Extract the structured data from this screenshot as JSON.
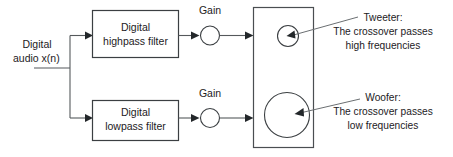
{
  "diagram": {
    "input": {
      "label_line1": "Digital",
      "label_line2_prefix": "audio ",
      "label_line2_signal": "x(n)"
    },
    "blocks": [
      {
        "id": "highpass",
        "label_line1": "Digital",
        "label_line2": "highpass filter"
      },
      {
        "id": "lowpass",
        "label_line1": "Digital",
        "label_line2": "lowpass filter"
      }
    ],
    "gains": [
      {
        "id": "gain-high",
        "label": "Gain"
      },
      {
        "id": "gain-low",
        "label": "Gain"
      }
    ],
    "speaker": {
      "cabinet_label": "Loudspeaker cabinet",
      "drivers": [
        {
          "id": "tweeter",
          "name": "Tweeter"
        },
        {
          "id": "woofer",
          "name": "Woofer"
        }
      ]
    },
    "annotations": [
      {
        "id": "tweeter-note",
        "line1": "Tweeter:",
        "line2": "The crossover passes",
        "line3": "high frequencies"
      },
      {
        "id": "woofer-note",
        "line1": "Woofer:",
        "line2": "The crossover passes",
        "line3": "low frequencies"
      }
    ],
    "colors": {
      "line": "#55595c",
      "box_stroke": "#3b3f42",
      "text": "#1d2124",
      "background": "#ffffff"
    }
  }
}
